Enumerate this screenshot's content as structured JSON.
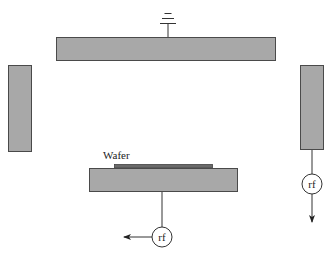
{
  "diagram": {
    "title": "",
    "labels": {
      "wafer": "Wafer",
      "rf_bottom": "rf",
      "rf_right": "rf"
    },
    "components": [
      {
        "id": "top-electrode",
        "type": "grounded electrode",
        "shape": "rect"
      },
      {
        "id": "ground-symbol",
        "type": "ground"
      },
      {
        "id": "left-wall",
        "type": "side electrode",
        "shape": "rect"
      },
      {
        "id": "right-wall",
        "type": "side electrode",
        "shape": "rect"
      },
      {
        "id": "wafer",
        "type": "wafer",
        "label": "Wafer"
      },
      {
        "id": "bottom-electrode",
        "type": "substrate electrode",
        "shape": "rect"
      },
      {
        "id": "rf-source-bottom",
        "type": "rf source",
        "label": "rf"
      },
      {
        "id": "rf-source-right",
        "type": "rf source",
        "label": "rf"
      }
    ],
    "connections": [
      {
        "from": "ground-symbol",
        "to": "top-electrode"
      },
      {
        "from": "bottom-electrode",
        "to": "rf-source-bottom",
        "then": "arrow-left"
      },
      {
        "from": "right-wall",
        "to": "rf-source-right",
        "then": "arrow-down"
      }
    ],
    "colors": {
      "plate_fill": "#a8a8a8",
      "plate_stroke": "#4a4a4a",
      "wafer_fill": "#6a6a6a",
      "line": "#333333"
    }
  }
}
